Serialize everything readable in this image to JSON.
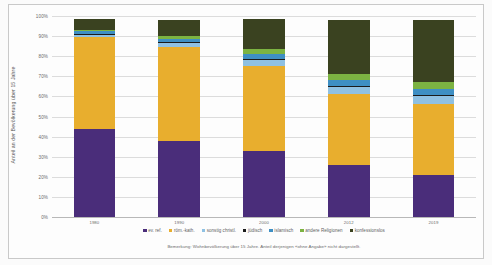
{
  "chart_data": {
    "type": "bar",
    "title": "",
    "xlabel": "",
    "ylabel": "Anteil an der Bevölkerung über 15 Jahre",
    "ylim": [
      0,
      100
    ],
    "grid": true,
    "stacked": true,
    "legend_position": "bottom",
    "categories": [
      "1980",
      "1990",
      "2000",
      "2012",
      "2019"
    ],
    "ytick_labels": [
      "0%",
      "10%",
      "20%",
      "30%",
      "40%",
      "50%",
      "60%",
      "70%",
      "80%",
      "90%",
      "100%"
    ],
    "ytick_values": [
      0,
      10,
      20,
      30,
      40,
      50,
      60,
      70,
      80,
      90,
      100
    ],
    "series": [
      {
        "name": "ev. ref.",
        "color": "#4A2D7A",
        "values": [
          44.0,
          38.0,
          33.0,
          26.0,
          21.0
        ]
      },
      {
        "name": "röm.-kath.",
        "color": "#E8AE2E",
        "values": [
          45.5,
          46.5,
          42.0,
          35.0,
          35.0
        ]
      },
      {
        "name": "sonstig christl.",
        "color": "#8FC1E3",
        "values": [
          1.5,
          2.5,
          3.5,
          4.0,
          4.5
        ]
      },
      {
        "name": "jüdisch",
        "color": "#1B1B1B",
        "values": [
          0.3,
          0.3,
          0.3,
          0.3,
          0.3
        ]
      },
      {
        "name": "islamisch",
        "color": "#3E8FC4",
        "values": [
          1.2,
          1.5,
          2.5,
          3.0,
          3.0
        ]
      },
      {
        "name": "andere Religionen",
        "color": "#7CB342",
        "values": [
          0.5,
          1.2,
          2.2,
          2.7,
          3.2
        ]
      },
      {
        "name": "konfessionslos",
        "color": "#3A4220",
        "values": [
          5.5,
          8.0,
          15.0,
          27.0,
          31.0
        ]
      }
    ],
    "note": "Bemerkung: Wohnbevölkerung über 15 Jahre. Anteil derjenigen «ohne Angabe» nicht dargestellt."
  }
}
